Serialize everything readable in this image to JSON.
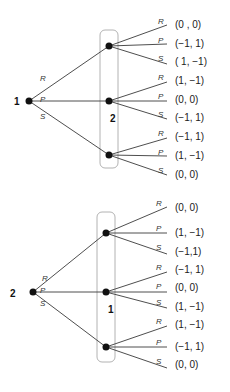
{
  "trees": [
    {
      "root_player": "1",
      "second_player": "2",
      "root_actions": [
        "R",
        "P",
        "S"
      ],
      "branches": [
        {
          "action": "R",
          "leaves": [
            {
              "action": "R",
              "payoff": "(0 , 0)"
            },
            {
              "action": "P",
              "payoff": "(−1, 1)"
            },
            {
              "action": "S",
              "payoff": "( 1, −1)"
            }
          ]
        },
        {
          "action": "P",
          "leaves": [
            {
              "action": "R",
              "payoff": "(1, −1)"
            },
            {
              "action": "P",
              "payoff": "(0, 0)"
            },
            {
              "action": "S",
              "payoff": "(−1, 1)"
            }
          ]
        },
        {
          "action": "S",
          "leaves": [
            {
              "action": "R",
              "payoff": "(−1, 1)"
            },
            {
              "action": "P",
              "payoff": "(1, −1)"
            },
            {
              "action": "S",
              "payoff": "(0, 0)"
            }
          ]
        }
      ]
    },
    {
      "root_player": "2",
      "second_player": "1",
      "root_actions": [
        "R",
        "P",
        "S"
      ],
      "branches": [
        {
          "action": "R",
          "leaves": [
            {
              "action": "R",
              "payoff": "(0, 0)"
            },
            {
              "action": "P",
              "payoff": "(1, −1)"
            },
            {
              "action": "S",
              "payoff": "(−1,1)"
            }
          ]
        },
        {
          "action": "P",
          "leaves": [
            {
              "action": "R",
              "payoff": "(−1, 1)"
            },
            {
              "action": "P",
              "payoff": "(0, 0)"
            },
            {
              "action": "S",
              "payoff": "(1, −1)"
            }
          ]
        },
        {
          "action": "S",
          "leaves": [
            {
              "action": "R",
              "payoff": "(1, −1)"
            },
            {
              "action": "P",
              "payoff": "(−1, 1)"
            },
            {
              "action": "S",
              "payoff": "(0, 0)"
            }
          ]
        }
      ]
    }
  ]
}
